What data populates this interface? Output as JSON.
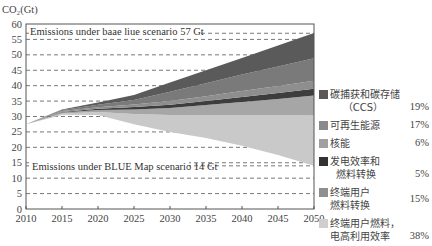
{
  "chart_data": {
    "type": "area",
    "title": "",
    "ylabel": "CO2(Gt)",
    "xlabel": "",
    "ylim": [
      0,
      60
    ],
    "xlim": [
      2010,
      2050
    ],
    "x_ticks": [
      2010,
      2015,
      2020,
      2025,
      2030,
      2035,
      2040,
      2045,
      2050
    ],
    "y_ticks": [
      0,
      5,
      10,
      15,
      20,
      25,
      30,
      35,
      40,
      45,
      50,
      55,
      60
    ],
    "grid": "dashed horizontal",
    "annotations": [
      {
        "text": "Emissions under baae liue scenario 57 Gt",
        "y": 57
      },
      {
        "text": "Emissions under BLUE Map scenario 14 Gt",
        "y": 14
      }
    ],
    "x": [
      2010,
      2015,
      2020,
      2025,
      2030,
      2035,
      2040,
      2045,
      2050
    ],
    "stack_base": [
      27.5,
      30.5,
      30.5,
      27.5,
      25,
      23,
      20.5,
      17.5,
      14
    ],
    "series": [
      {
        "name": "终端用户燃料，电高利用效率",
        "share": "38%",
        "color": "#c9c9c9",
        "values": [
          0,
          0.5,
          1.0,
          3.3,
          5.5,
          7.5,
          10.0,
          13.0,
          16.3
        ]
      },
      {
        "name": "终端用户燃料转换",
        "share": "15%",
        "color": "#a6a6a6",
        "values": [
          0,
          0.3,
          0.6,
          1.5,
          2.3,
          3.2,
          4.2,
          5.2,
          6.5
        ]
      },
      {
        "name": "发电效率和燃料转换",
        "share": "5%",
        "color": "#3d3d3d",
        "values": [
          0,
          0.2,
          0.4,
          0.8,
          1.0,
          1.3,
          1.6,
          1.9,
          2.2
        ]
      },
      {
        "name": "核能",
        "share": "6%",
        "color": "#8e8e8e",
        "values": [
          0,
          0.3,
          0.5,
          0.8,
          1.2,
          1.6,
          2.0,
          2.3,
          2.6
        ]
      },
      {
        "name": "可再生能源",
        "share": "17%",
        "color": "#7a7a7a",
        "values": [
          0,
          0.3,
          0.8,
          1.5,
          3.0,
          4.2,
          5.3,
          6.3,
          7.3
        ]
      },
      {
        "name": "碳捕获和碳存储（CCS）",
        "share": "19%",
        "color": "#5a5a5a",
        "values": [
          0,
          0.2,
          0.7,
          1.6,
          3.0,
          4.2,
          5.4,
          6.8,
          8.2
        ]
      }
    ],
    "legend_position": "right"
  },
  "axis": {
    "ylabel": "CO₂(Gt)",
    "x_ticks": [
      "2010",
      "2015",
      "2020",
      "2025",
      "2030",
      "2035",
      "2040",
      "2045",
      "2050"
    ],
    "y_ticks": [
      "0",
      "5",
      "10",
      "15",
      "20",
      "25",
      "30",
      "35",
      "40",
      "45",
      "50",
      "55",
      "60"
    ]
  },
  "annotations": {
    "baseline": "Emissions under baae liue scenario 57 Gt",
    "blue_map": "Emissions under BLUE Map scenario 14 Gt"
  },
  "legend": [
    {
      "label": "碳捕获和碳存储\n    （CCS）",
      "pct": "19%",
      "color": "#595959"
    },
    {
      "label": "可再生能源",
      "pct": "17%",
      "color": "#8a8a8a"
    },
    {
      "label": "核能",
      "pct": "6%",
      "color": "#a0a0a0"
    },
    {
      "label": "发电效率和\n  燃料转换",
      "pct": "5%",
      "color": "#333333"
    },
    {
      "label": "终端用户\n燃料转换",
      "pct": "15%",
      "color": "#8f8f8f"
    },
    {
      "label": "终端用户燃料，\n电高利用效率",
      "pct": "38%",
      "color": "#cfcfcf"
    }
  ]
}
